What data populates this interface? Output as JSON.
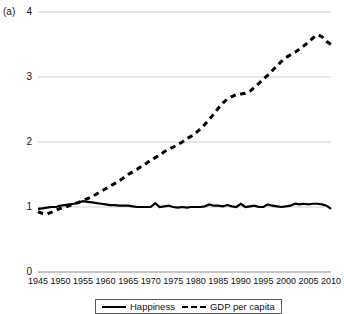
{
  "figure": {
    "panel_label": "(a)"
  },
  "chart_data": {
    "type": "line",
    "title": "",
    "xlabel": "",
    "ylabel": "",
    "xlim": [
      1945,
      2010
    ],
    "ylim": [
      0,
      4
    ],
    "grid": true,
    "gridlines_y": [
      0,
      1,
      2,
      3,
      4
    ],
    "legend_position": "bottom",
    "yticks": [
      "0",
      "1",
      "2",
      "3",
      "4"
    ],
    "ytick_values": [
      0,
      1,
      2,
      3,
      4
    ],
    "xticks": [
      "1945",
      "1950",
      "1955",
      "1960",
      "1965",
      "1970",
      "1975",
      "1980",
      "1985",
      "1990",
      "1995",
      "2000",
      "2005",
      "2010"
    ],
    "xtick_values": [
      1945,
      1950,
      1955,
      1960,
      1965,
      1970,
      1975,
      1980,
      1985,
      1990,
      1995,
      2000,
      2005,
      2010
    ],
    "x": [
      1945,
      1946,
      1947,
      1948,
      1949,
      1950,
      1951,
      1952,
      1953,
      1954,
      1955,
      1956,
      1957,
      1958,
      1959,
      1960,
      1961,
      1962,
      1963,
      1964,
      1965,
      1966,
      1967,
      1968,
      1969,
      1970,
      1971,
      1972,
      1973,
      1974,
      1975,
      1976,
      1977,
      1978,
      1979,
      1980,
      1981,
      1982,
      1983,
      1984,
      1985,
      1986,
      1987,
      1988,
      1989,
      1990,
      1991,
      1992,
      1993,
      1994,
      1995,
      1996,
      1997,
      1998,
      1999,
      2000,
      2001,
      2002,
      2003,
      2004,
      2005,
      2006,
      2007,
      2008,
      2009,
      2010
    ],
    "series": [
      {
        "name": "Happiness",
        "style": "solid",
        "color": "#000000",
        "values": [
          0.97,
          0.98,
          0.99,
          1.0,
          1.0,
          1.02,
          1.03,
          1.04,
          1.05,
          1.07,
          1.09,
          1.08,
          1.07,
          1.06,
          1.05,
          1.04,
          1.03,
          1.03,
          1.02,
          1.02,
          1.02,
          1.01,
          1.0,
          1.0,
          1.0,
          1.0,
          1.06,
          1.0,
          1.01,
          1.02,
          1.0,
          0.99,
          1.0,
          0.99,
          1.0,
          1.0,
          1.0,
          1.01,
          1.04,
          1.02,
          1.02,
          1.01,
          1.03,
          1.01,
          1.0,
          1.05,
          1.0,
          1.01,
          1.02,
          1.0,
          1.0,
          1.04,
          1.02,
          1.01,
          1.0,
          1.01,
          1.02,
          1.05,
          1.04,
          1.05,
          1.04,
          1.05,
          1.05,
          1.04,
          1.02,
          0.97
        ]
      },
      {
        "name": "GDP per capita",
        "style": "dashed",
        "color": "#000000",
        "values": [
          0.93,
          0.9,
          0.89,
          0.92,
          0.95,
          0.98,
          1.0,
          1.02,
          1.05,
          1.07,
          1.1,
          1.13,
          1.16,
          1.2,
          1.24,
          1.28,
          1.32,
          1.36,
          1.4,
          1.45,
          1.5,
          1.54,
          1.58,
          1.63,
          1.67,
          1.72,
          1.76,
          1.8,
          1.85,
          1.89,
          1.92,
          1.96,
          2.0,
          2.05,
          2.09,
          2.14,
          2.2,
          2.27,
          2.35,
          2.43,
          2.52,
          2.6,
          2.66,
          2.7,
          2.73,
          2.74,
          2.75,
          2.78,
          2.84,
          2.9,
          2.97,
          3.03,
          3.1,
          3.17,
          3.24,
          3.3,
          3.34,
          3.38,
          3.43,
          3.48,
          3.54,
          3.6,
          3.65,
          3.62,
          3.55,
          3.5
        ]
      }
    ]
  },
  "legend": {
    "entries": [
      {
        "label": "Happiness",
        "style": "solid"
      },
      {
        "label": "GDP per capita",
        "style": "dashed"
      }
    ]
  }
}
